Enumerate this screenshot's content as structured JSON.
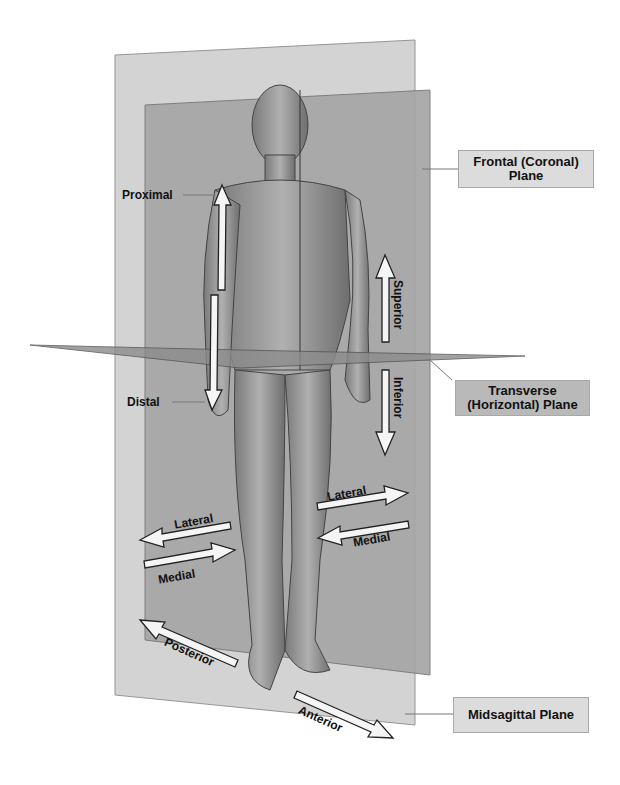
{
  "diagram": {
    "planes": {
      "frontal": {
        "label_line1": "Frontal (Coronal)",
        "label_line2": "Plane"
      },
      "transverse": {
        "label_line1": "Transverse",
        "label_line2": "(Horizontal) Plane"
      },
      "midsagittal": {
        "label": "Midsagittal Plane"
      }
    },
    "directions": {
      "proximal": "Proximal",
      "distal": "Distal",
      "superior": "Superior",
      "inferior": "Inferior",
      "lateral_left": "Lateral",
      "medial_left": "Medial",
      "lateral_right": "Lateral",
      "medial_right": "Medial",
      "posterior": "Posterior",
      "anterior": "Anterior"
    },
    "colors": {
      "midsagittal_plane": "#c8c8c8",
      "frontal_plane": "#a9a9a9",
      "transverse_plane": "#8f8f8f",
      "body": "#9a9a9a",
      "arrow_fill": "#f5f5f5",
      "arrow_stroke": "#222222"
    }
  }
}
